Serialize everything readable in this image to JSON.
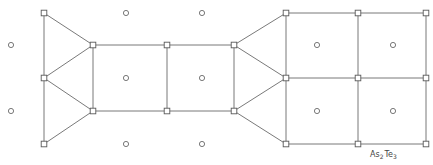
{
  "diagram": {
    "label": {
      "main1": "As",
      "sub1": "2",
      "main2": "Te",
      "sub2": "3",
      "x": 370,
      "y": 157
    },
    "colors": {
      "stroke": "#6a6a6a",
      "background": "#ffffff"
    },
    "square_nodes": [
      [
        44,
        13
      ],
      [
        44,
        78
      ],
      [
        44,
        144
      ],
      [
        93,
        45
      ],
      [
        93,
        111
      ],
      [
        167,
        45
      ],
      [
        167,
        111
      ],
      [
        234,
        45
      ],
      [
        234,
        111
      ],
      [
        286,
        13
      ],
      [
        286,
        78
      ],
      [
        286,
        144
      ],
      [
        358,
        13
      ],
      [
        358,
        78
      ],
      [
        358,
        144
      ],
      [
        426,
        13
      ],
      [
        426,
        78
      ],
      [
        426,
        144
      ]
    ],
    "circle_nodes": [
      [
        11,
        45
      ],
      [
        11,
        111
      ],
      [
        126,
        13
      ],
      [
        126,
        78
      ],
      [
        126,
        144
      ],
      [
        202,
        13
      ],
      [
        202,
        78
      ],
      [
        202,
        144
      ],
      [
        317,
        45
      ],
      [
        317,
        111
      ],
      [
        393,
        45
      ],
      [
        393,
        111
      ]
    ],
    "edges": [
      [
        44,
        13,
        44,
        144
      ],
      [
        44,
        13,
        93,
        45
      ],
      [
        44,
        78,
        93,
        45
      ],
      [
        44,
        78,
        93,
        111
      ],
      [
        44,
        144,
        93,
        111
      ],
      [
        93,
        45,
        93,
        111
      ],
      [
        93,
        45,
        234,
        45
      ],
      [
        93,
        111,
        234,
        111
      ],
      [
        167,
        45,
        167,
        111
      ],
      [
        234,
        45,
        234,
        111
      ],
      [
        234,
        45,
        286,
        13
      ],
      [
        234,
        45,
        286,
        78
      ],
      [
        234,
        111,
        286,
        78
      ],
      [
        234,
        111,
        286,
        144
      ],
      [
        286,
        13,
        426,
        13
      ],
      [
        286,
        78,
        426,
        78
      ],
      [
        286,
        144,
        426,
        144
      ],
      [
        286,
        13,
        286,
        144
      ],
      [
        358,
        13,
        358,
        144
      ],
      [
        426,
        13,
        426,
        144
      ]
    ]
  }
}
